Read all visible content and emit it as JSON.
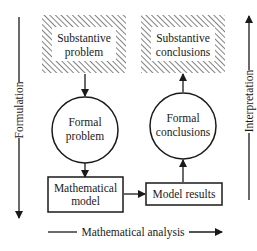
{
  "diagram": {
    "type": "flow",
    "nodes": {
      "substantive_problem": {
        "line1": "Substantive",
        "line2": "problem",
        "shape": "hatched-rect"
      },
      "formal_problem": {
        "line1": "Formal",
        "line2": "problem",
        "shape": "circle"
      },
      "mathematical_model": {
        "line1": "Mathematical",
        "line2": "model",
        "shape": "rect"
      },
      "model_results": {
        "line1": "Model results",
        "shape": "rect"
      },
      "formal_conclusions": {
        "line1": "Formal",
        "line2": "conclusions",
        "shape": "circle"
      },
      "substantive_conclusions": {
        "line1": "Substantive",
        "line2": "conclusions",
        "shape": "hatched-rect"
      }
    },
    "edges": [
      {
        "from": "substantive_problem",
        "to": "formal_problem"
      },
      {
        "from": "formal_problem",
        "to": "mathematical_model"
      },
      {
        "from": "mathematical_model",
        "to": "model_results"
      },
      {
        "from": "model_results",
        "to": "formal_conclusions"
      },
      {
        "from": "formal_conclusions",
        "to": "substantive_conclusions"
      }
    ],
    "axes": {
      "left": "Formulation",
      "right": "Interpretation",
      "bottom": "Mathematical analysis"
    },
    "colors": {
      "ink": "#1a1a1a",
      "background": "#ffffff"
    }
  }
}
